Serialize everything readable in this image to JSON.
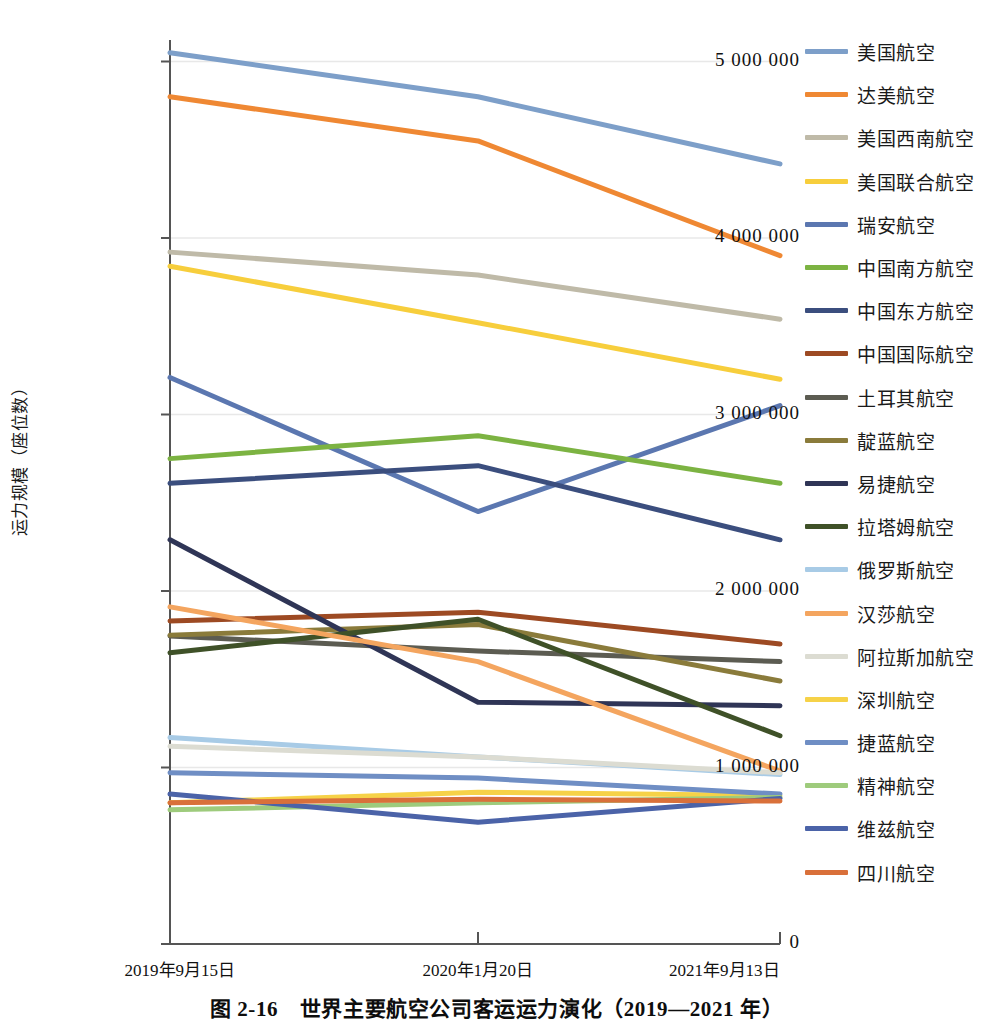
{
  "caption": "图 2-16　世界主要航空公司客运运力演化（2019—2021 年）",
  "axes": {
    "y_title": "运力规模（座位数）",
    "y_ticks": [
      "5 000 000",
      "4 000 000",
      "3 000 000",
      "2 000 000",
      "1 000 000",
      "0"
    ],
    "x_ticks": [
      "2019年9月15日",
      "2020年1月20日",
      "2021年9月13日"
    ]
  },
  "chart_data": {
    "type": "line",
    "title": "图 2-16　世界主要航空公司客运运力演化（2019—2021 年）",
    "xlabel": "",
    "ylabel": "运力规模（座位数）",
    "x": [
      "2019年9月15日",
      "2020年1月20日",
      "2021年9月13日"
    ],
    "ylim": [
      0,
      5300000
    ],
    "yticks": [
      0,
      1000000,
      2000000,
      3000000,
      4000000,
      5000000
    ],
    "grid": true,
    "legend_position": "right",
    "series": [
      {
        "name": "美国航空",
        "color": "#7d9fc9",
        "values": [
          5050000,
          4800000,
          4420000
        ]
      },
      {
        "name": "达美航空",
        "color": "#ef8833",
        "values": [
          4800000,
          4550000,
          3900000
        ]
      },
      {
        "name": "美国西南航空",
        "color": "#bfbaa8",
        "values": [
          3920000,
          3790000,
          3540000
        ]
      },
      {
        "name": "美国联合航空",
        "color": "#f7ce3c",
        "values": [
          3840000,
          3520000,
          3200000
        ]
      },
      {
        "name": "瑞安航空",
        "color": "#5b77b0",
        "values": [
          3210000,
          2450000,
          3050000
        ]
      },
      {
        "name": "中国南方航空",
        "color": "#7cb342",
        "values": [
          2750000,
          2880000,
          2610000
        ]
      },
      {
        "name": "中国东方航空",
        "color": "#3b4e7e",
        "values": [
          2610000,
          2710000,
          2290000
        ]
      },
      {
        "name": "中国国际航空",
        "color": "#9d4a23",
        "values": [
          1830000,
          1880000,
          1700000
        ]
      },
      {
        "name": "土耳其航空",
        "color": "#5c5c52",
        "values": [
          1745000,
          1660000,
          1600000
        ]
      },
      {
        "name": "靛蓝航空",
        "color": "#8a7b3b",
        "values": [
          1750000,
          1810000,
          1490000
        ]
      },
      {
        "name": "易捷航空",
        "color": "#2f3556",
        "values": [
          2290000,
          1370000,
          1350000
        ]
      },
      {
        "name": "拉塔姆航空",
        "color": "#3f5128",
        "values": [
          1650000,
          1840000,
          1180000
        ]
      },
      {
        "name": "俄罗斯航空",
        "color": "#a8cbe6",
        "values": [
          1170000,
          1060000,
          960000
        ]
      },
      {
        "name": "汉莎航空",
        "color": "#f4a55f",
        "values": [
          1910000,
          1600000,
          980000
        ]
      },
      {
        "name": "阿拉斯加航空",
        "color": "#dcdcd2",
        "values": [
          1120000,
          1060000,
          970000
        ]
      },
      {
        "name": "深圳航空",
        "color": "#f6d248",
        "values": [
          800000,
          860000,
          840000
        ]
      },
      {
        "name": "捷蓝航空",
        "color": "#6f8ec4",
        "values": [
          970000,
          940000,
          850000
        ]
      },
      {
        "name": "精神航空",
        "color": "#9ecb7c",
        "values": [
          760000,
          800000,
          830000
        ]
      },
      {
        "name": "维兹航空",
        "color": "#4b63a8",
        "values": [
          850000,
          690000,
          825000
        ]
      },
      {
        "name": "四川航空",
        "color": "#d9703a",
        "values": [
          800000,
          820000,
          810000
        ]
      }
    ]
  }
}
